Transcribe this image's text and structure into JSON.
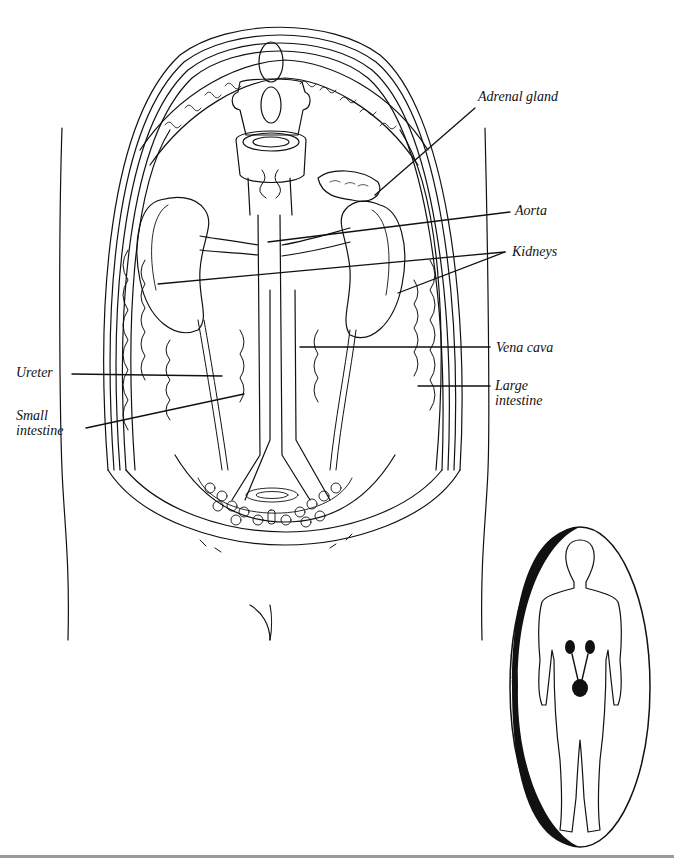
{
  "diagram": {
    "colors": {
      "ink": "#111111",
      "paper": "#ffffff",
      "rule": "#9a9a9a"
    },
    "labels": [
      {
        "id": "adrenal-gland",
        "text": "Adrenal gland",
        "x": 478,
        "y": 97
      },
      {
        "id": "aorta",
        "text": "Aorta",
        "x": 515,
        "y": 202
      },
      {
        "id": "kidneys",
        "text": "Kidneys",
        "x": 512,
        "y": 243
      },
      {
        "id": "vena-cava",
        "text": "Vena cava",
        "x": 496,
        "y": 340
      },
      {
        "id": "large-intestine",
        "text": "Large\nintestine",
        "x": 495,
        "y": 378
      },
      {
        "id": "ureter",
        "text": "Ureter",
        "x": 16,
        "y": 364
      },
      {
        "id": "small-intestine",
        "text": "Small\nintestine",
        "x": 16,
        "y": 408
      }
    ],
    "inset": {
      "description": "Whole-body silhouette in oval highlighting kidneys, ureters and bladder"
    }
  }
}
